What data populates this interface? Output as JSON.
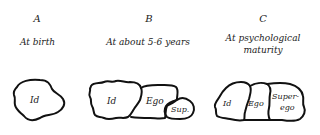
{
  "panels": [
    {
      "letter": "A",
      "caption_line1": "At birth",
      "caption_line2": "",
      "regions": [
        "Id"
      ]
    },
    {
      "letter": "B",
      "caption_line1": "At about 5-6 years",
      "caption_line2": "",
      "regions": [
        "Id",
        "Ego",
        "Sup."
      ]
    },
    {
      "letter": "C",
      "caption_line1": "At psychological",
      "caption_line2": "maturity",
      "regions": [
        "Id",
        "Ego",
        "Super-",
        "ego"
      ]
    }
  ],
  "colors": {
    "outline": "#111111",
    "text": "#222222",
    "background": "#ffffff"
  }
}
